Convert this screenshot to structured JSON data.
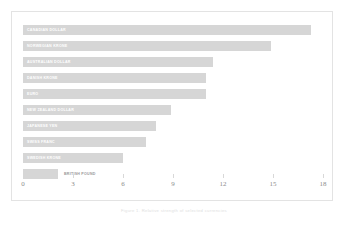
{
  "caption": "Figure 1. Relative strength of selected currencies",
  "colors": {
    "bar": "#d6d6d6",
    "frame_border": "#e3e3e3",
    "axis_text": "#8d8d8d",
    "bar_label": "#ffffff"
  },
  "chart_data": {
    "type": "bar",
    "orientation": "horizontal",
    "title": "",
    "xlabel": "",
    "ylabel": "",
    "xlim": [
      0,
      18
    ],
    "xticks": [
      0,
      3,
      6,
      9,
      12,
      15,
      18
    ],
    "xtick_labels": [
      "0",
      "3",
      "6",
      "9",
      "12",
      "15",
      "18"
    ],
    "grid": false,
    "legend": "none",
    "categories": [
      "CANADIAN DOLLAR",
      "NORWEGIAN KRONE",
      "AUSTRALIAN DOLLAR",
      "DANISH KRONE",
      "EURO",
      "NEW ZEALAND DOLLAR",
      "JAPANESE YEN",
      "SWISS FRANC",
      "SWEDISH KRONE",
      "BRITISH POUND"
    ],
    "values": [
      17.3,
      14.9,
      11.4,
      11.0,
      11.0,
      8.9,
      8.0,
      7.4,
      6.0,
      2.1
    ]
  }
}
